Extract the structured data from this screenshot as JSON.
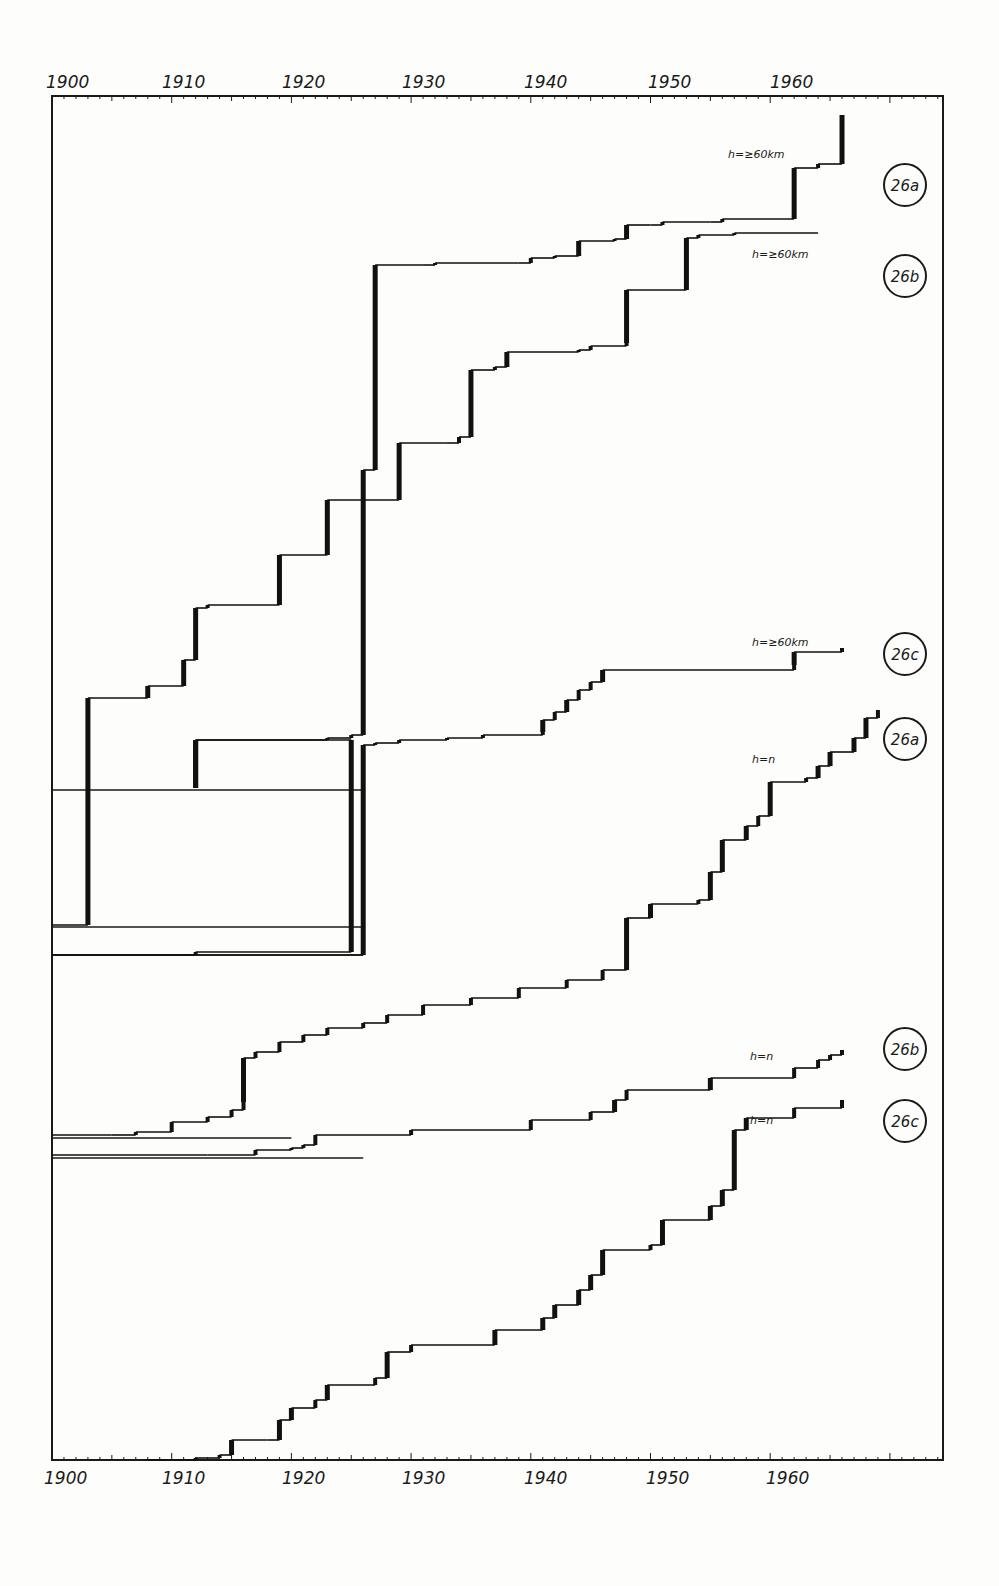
{
  "chart_data": {
    "type": "line",
    "subtype": "cumulative step curves",
    "title": "",
    "xlabel": "",
    "ylabel": "",
    "x_ticks_top": [
      "1900",
      "1910",
      "1920",
      "1930",
      "1940",
      "1950",
      "1960"
    ],
    "x_ticks_bottom": [
      "1900",
      "1910",
      "1920",
      "1930",
      "1940",
      "1950",
      "1960"
    ],
    "xlim": [
      1900,
      1974
    ],
    "grid": false,
    "legend_position": "right (circled series badges)",
    "series": [
      {
        "name": "26a",
        "label": "h=≥60km",
        "badge": "26a",
        "points": [
          [
            1900,
            925
          ],
          [
            1903,
            925
          ],
          [
            1903,
            698
          ],
          [
            1908,
            698
          ],
          [
            1908,
            686
          ],
          [
            1911,
            686
          ],
          [
            1911,
            660
          ],
          [
            1912,
            660
          ],
          [
            1912,
            608
          ],
          [
            1913,
            608
          ],
          [
            1913,
            605
          ],
          [
            1919,
            605
          ],
          [
            1919,
            555
          ],
          [
            1923,
            555
          ],
          [
            1923,
            500
          ],
          [
            1926,
            500
          ],
          [
            1926,
            470
          ],
          [
            1927,
            470
          ],
          [
            1927,
            265
          ],
          [
            1931,
            265
          ],
          [
            1932,
            263
          ],
          [
            1939,
            263
          ],
          [
            1940,
            258
          ],
          [
            1942,
            256
          ],
          [
            1944,
            241
          ],
          [
            1947,
            239
          ],
          [
            1948,
            225
          ],
          [
            1950,
            225
          ],
          [
            1951,
            222
          ],
          [
            1955,
            222
          ],
          [
            1956,
            219
          ],
          [
            1962,
            219
          ],
          [
            1962,
            168
          ],
          [
            1964,
            168
          ],
          [
            1964,
            164
          ],
          [
            1966,
            164
          ],
          [
            1966,
            115
          ]
        ]
      },
      {
        "name": "26b",
        "label": "h=≥60km",
        "badge": "26b",
        "points": [
          [
            1900,
            955
          ],
          [
            1911,
            955
          ],
          [
            1912,
            952
          ],
          [
            1925,
            952
          ],
          [
            1925,
            740
          ],
          [
            1922,
            740
          ],
          [
            1912,
            740
          ],
          [
            1912,
            788
          ],
          [
            1912,
            740
          ],
          [
            1923,
            738
          ],
          [
            1925,
            735
          ],
          [
            1926,
            735
          ],
          [
            1926,
            500
          ],
          [
            1929,
            500
          ],
          [
            1929,
            443
          ],
          [
            1933,
            443
          ],
          [
            1934,
            437
          ],
          [
            1935,
            437
          ],
          [
            1935,
            370
          ],
          [
            1937,
            367
          ],
          [
            1938,
            352
          ],
          [
            1944,
            350
          ],
          [
            1945,
            346
          ],
          [
            1948,
            343
          ],
          [
            1948,
            290
          ],
          [
            1953,
            290
          ],
          [
            1953,
            238
          ],
          [
            1954,
            235
          ],
          [
            1957,
            233
          ],
          [
            1964,
            233
          ]
        ]
      },
      {
        "name": "26c",
        "label": "h=≥60km",
        "badge": "26c",
        "points": [
          [
            1900,
            955
          ],
          [
            1926,
            955
          ],
          [
            1926,
            745
          ],
          [
            1927,
            743
          ],
          [
            1929,
            740
          ],
          [
            1933,
            738
          ],
          [
            1936,
            735
          ],
          [
            1941,
            732
          ],
          [
            1941,
            720
          ],
          [
            1942,
            712
          ],
          [
            1943,
            700
          ],
          [
            1944,
            690
          ],
          [
            1945,
            682
          ],
          [
            1946,
            670
          ],
          [
            1962,
            665
          ],
          [
            1962,
            652
          ],
          [
            1966,
            652
          ],
          [
            1966,
            648
          ]
        ]
      },
      {
        "name": "26a",
        "label": "h=n",
        "badge": "26a",
        "points": [
          [
            1900,
            1135
          ],
          [
            1905,
            1135
          ],
          [
            1907,
            1132
          ],
          [
            1910,
            1130
          ],
          [
            1910,
            1122
          ],
          [
            1913,
            1117
          ],
          [
            1915,
            1110
          ],
          [
            1916,
            1102
          ],
          [
            1916,
            1058
          ],
          [
            1917,
            1052
          ],
          [
            1919,
            1042
          ],
          [
            1921,
            1035
          ],
          [
            1923,
            1028
          ],
          [
            1926,
            1023
          ],
          [
            1928,
            1015
          ],
          [
            1931,
            1005
          ],
          [
            1935,
            998
          ],
          [
            1939,
            988
          ],
          [
            1943,
            980
          ],
          [
            1946,
            970
          ],
          [
            1948,
            953
          ],
          [
            1948,
            918
          ],
          [
            1950,
            904
          ],
          [
            1954,
            900
          ],
          [
            1955,
            872
          ],
          [
            1956,
            840
          ],
          [
            1958,
            826
          ],
          [
            1959,
            816
          ],
          [
            1960,
            782
          ],
          [
            1963,
            778
          ],
          [
            1964,
            766
          ],
          [
            1965,
            752
          ],
          [
            1967,
            738
          ],
          [
            1968,
            718
          ],
          [
            1969,
            710
          ]
        ]
      },
      {
        "name": "26b",
        "label": "h=n",
        "badge": "26b",
        "points": [
          [
            1900,
            1155
          ],
          [
            1913,
            1155
          ],
          [
            1917,
            1150
          ],
          [
            1920,
            1148
          ],
          [
            1921,
            1145
          ],
          [
            1922,
            1135
          ],
          [
            1930,
            1130
          ],
          [
            1940,
            1120
          ],
          [
            1945,
            1112
          ],
          [
            1947,
            1100
          ],
          [
            1948,
            1090
          ],
          [
            1955,
            1078
          ],
          [
            1962,
            1068
          ],
          [
            1964,
            1060
          ],
          [
            1965,
            1055
          ],
          [
            1966,
            1050
          ]
        ]
      },
      {
        "name": "26c",
        "label": "h=n",
        "badge": "26c",
        "points": [
          [
            1908,
            1460
          ],
          [
            1912,
            1458
          ],
          [
            1914,
            1455
          ],
          [
            1915,
            1440
          ],
          [
            1918,
            1440
          ],
          [
            1919,
            1420
          ],
          [
            1920,
            1408
          ],
          [
            1922,
            1400
          ],
          [
            1923,
            1385
          ],
          [
            1927,
            1378
          ],
          [
            1928,
            1352
          ],
          [
            1930,
            1345
          ],
          [
            1937,
            1330
          ],
          [
            1941,
            1318
          ],
          [
            1942,
            1305
          ],
          [
            1944,
            1290
          ],
          [
            1945,
            1275
          ],
          [
            1946,
            1250
          ],
          [
            1950,
            1245
          ],
          [
            1951,
            1220
          ],
          [
            1955,
            1206
          ],
          [
            1956,
            1190
          ],
          [
            1957,
            1130
          ],
          [
            1958,
            1118
          ],
          [
            1962,
            1108
          ],
          [
            1966,
            1100
          ]
        ]
      }
    ],
    "reference_lines": [
      {
        "x_from": 1900,
        "x_to": 1926,
        "y": 790
      },
      {
        "x_from": 1900,
        "x_to": 1926,
        "y": 927
      },
      {
        "x_from": 1900,
        "x_to": 1926,
        "y": 955
      },
      {
        "x_from": 1900,
        "x_to": 1920,
        "y": 1138
      },
      {
        "x_from": 1900,
        "x_to": 1926,
        "y": 1158
      }
    ],
    "annotations": [
      "h=≥60km",
      "h=≥60km",
      "h=≥60km",
      "h=n",
      "h=n",
      "h=n"
    ]
  },
  "labels": {
    "curve_26a_top": "h=≥60km",
    "curve_26b_top": "h=≥60km",
    "curve_26c_top": "h=≥60km",
    "curve_26a_n": "h=n",
    "curve_26b_n": "h=n",
    "curve_26c_n": "h=n"
  },
  "badges": [
    "26a",
    "26b",
    "26c",
    "26a",
    "26b",
    "26c"
  ],
  "axis": {
    "top": [
      "1900",
      "1910",
      "1920",
      "1930",
      "1940",
      "1950",
      "1960"
    ],
    "bottom": [
      "1900",
      "1910",
      "1920",
      "1930",
      "1940",
      "1950",
      "1960"
    ]
  }
}
